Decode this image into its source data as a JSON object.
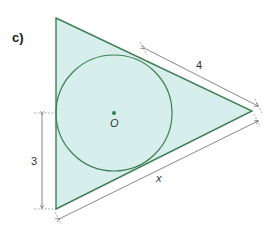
{
  "figure": {
    "part_label": "c)",
    "center_label": "O",
    "tangent_length_label": "4",
    "height_segment_label": "3",
    "unknown_side_label": "x"
  },
  "colors": {
    "fill": "#d7efec",
    "stroke": "#3f7f52",
    "dimension_line": "#555555",
    "center_dot": "#2e7d4f"
  },
  "geometry": {
    "triangle": {
      "top": [
        56,
        18
      ],
      "right": [
        252,
        111
      ],
      "bottom": [
        56,
        209
      ]
    },
    "incircle": {
      "center": [
        114,
        113
      ],
      "radius": 58
    }
  }
}
